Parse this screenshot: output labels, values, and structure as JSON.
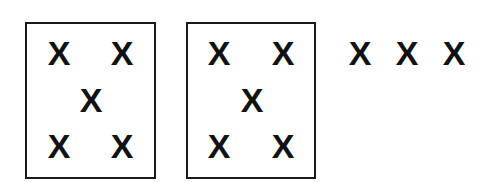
{
  "figure": {
    "groups": [
      {
        "id": "group-1",
        "boxed": true,
        "box": {
          "left": 25,
          "top": 22,
          "width": 131,
          "height": 157
        },
        "marks": [
          {
            "label": "X",
            "x": 46,
            "y": 39
          },
          {
            "label": "X",
            "x": 109,
            "y": 39
          },
          {
            "label": "X",
            "x": 78,
            "y": 86
          },
          {
            "label": "X",
            "x": 46,
            "y": 132
          },
          {
            "label": "X",
            "x": 109,
            "y": 132
          }
        ]
      },
      {
        "id": "group-2",
        "boxed": true,
        "box": {
          "left": 186,
          "top": 22,
          "width": 130,
          "height": 157
        },
        "marks": [
          {
            "label": "X",
            "x": 206,
            "y": 39
          },
          {
            "label": "X",
            "x": 270,
            "y": 39
          },
          {
            "label": "X",
            "x": 239,
            "y": 86
          },
          {
            "label": "X",
            "x": 206,
            "y": 132
          },
          {
            "label": "X",
            "x": 270,
            "y": 132
          }
        ]
      },
      {
        "id": "group-3",
        "boxed": false,
        "marks": [
          {
            "label": "X",
            "x": 347,
            "y": 39
          },
          {
            "label": "X",
            "x": 394,
            "y": 39
          },
          {
            "label": "X",
            "x": 441,
            "y": 39
          }
        ]
      }
    ],
    "colors": {
      "ink": "#111111",
      "border": "#1a1a1a",
      "background": "#ffffff"
    }
  }
}
